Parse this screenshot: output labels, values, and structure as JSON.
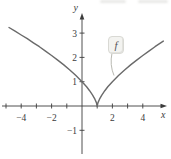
{
  "chart_data": {
    "type": "line",
    "title": "",
    "xlabel": "x",
    "ylabel": "y",
    "xlim": [
      -5.3,
      5.6
    ],
    "ylim": [
      -2.0,
      3.8
    ],
    "grid": false,
    "x_ticks": [
      {
        "v": -5,
        "label": ""
      },
      {
        "v": -4,
        "label": "−4"
      },
      {
        "v": -3,
        "label": ""
      },
      {
        "v": -2,
        "label": "−2"
      },
      {
        "v": -1,
        "label": ""
      },
      {
        "v": 1,
        "label": ""
      },
      {
        "v": 2,
        "label": "2"
      },
      {
        "v": 3,
        "label": ""
      },
      {
        "v": 4,
        "label": "4"
      }
    ],
    "y_ticks": [
      {
        "v": -1,
        "label": "−1"
      },
      {
        "v": 1,
        "label": "1"
      },
      {
        "v": 2,
        "label": "2"
      },
      {
        "v": 3,
        "label": "3"
      }
    ],
    "series": [
      {
        "name": "f",
        "label": "f",
        "color": "#6a6a6a",
        "cusp_point": [
          1,
          0
        ],
        "y_intercept": [
          0,
          1
        ],
        "points": [
          [
            -4.8,
            3.23
          ],
          [
            -4.4,
            3.08
          ],
          [
            -4.0,
            2.92
          ],
          [
            -3.6,
            2.77
          ],
          [
            -3.2,
            2.6
          ],
          [
            -2.8,
            2.44
          ],
          [
            -2.4,
            2.26
          ],
          [
            -2.0,
            2.08
          ],
          [
            -1.6,
            1.89
          ],
          [
            -1.2,
            1.69
          ],
          [
            -0.8,
            1.48
          ],
          [
            -0.4,
            1.25
          ],
          [
            0.0,
            1.0
          ],
          [
            0.3,
            0.79
          ],
          [
            0.5,
            0.63
          ],
          [
            0.7,
            0.45
          ],
          [
            0.85,
            0.28
          ],
          [
            0.95,
            0.14
          ],
          [
            1.0,
            0.0
          ],
          [
            1.05,
            0.14
          ],
          [
            1.15,
            0.28
          ],
          [
            1.3,
            0.45
          ],
          [
            1.5,
            0.63
          ],
          [
            1.7,
            0.79
          ],
          [
            2.0,
            1.0
          ],
          [
            2.4,
            1.25
          ],
          [
            2.8,
            1.48
          ],
          [
            3.2,
            1.69
          ],
          [
            3.6,
            1.89
          ],
          [
            4.0,
            2.08
          ],
          [
            4.4,
            2.26
          ],
          [
            4.8,
            2.44
          ],
          [
            5.35,
            2.67
          ]
        ]
      }
    ],
    "annotations": [
      {
        "type": "callout-bubble",
        "text": "f",
        "anchor_data_xy": [
          2.1,
          1.0
        ]
      }
    ],
    "legend": "none"
  },
  "colors": {
    "axis": "#3c3c3c",
    "tick_text": "#3c3c3c",
    "curve": "#6a6a6a",
    "callout_bg": "#f3f3f0",
    "callout_border": "#d9d9d4",
    "callout_tail": "#b9b9b2"
  }
}
